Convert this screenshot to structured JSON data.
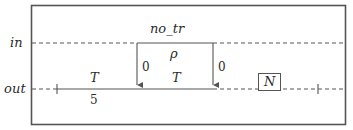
{
  "diagram": {
    "type": "timing-diagram",
    "frame": {
      "stroke": "#555555"
    },
    "lanes": [
      {
        "id": "in",
        "label": "in",
        "y": 43
      },
      {
        "id": "out",
        "label": "out",
        "y": 89
      }
    ],
    "signal": {
      "name": "no_tr",
      "value": "ρ"
    },
    "transitions": [
      {
        "id": "left-edge",
        "x": 137,
        "label": "0"
      },
      {
        "id": "right-edge",
        "x": 213,
        "label": "0"
      }
    ],
    "out_segments": [
      {
        "id": "segment-1",
        "upper": "T",
        "lower": "5"
      },
      {
        "id": "segment-2",
        "upper": "T",
        "lower": ""
      }
    ],
    "counter": {
      "label": "N"
    },
    "colors": {
      "line": "#555555",
      "text": "#2b2b2b",
      "background": "#ffffff"
    }
  }
}
